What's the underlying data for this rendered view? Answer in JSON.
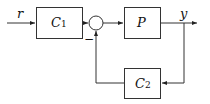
{
  "diagram": {
    "type": "block-diagram",
    "blocks": [
      {
        "id": "C1",
        "label": "C",
        "subscript": "1"
      },
      {
        "id": "P",
        "label": "P"
      },
      {
        "id": "C2",
        "label": "C",
        "subscript": "2"
      }
    ],
    "summing_junction": {
      "feedback_sign": "−"
    },
    "signals": {
      "input": "r",
      "output": "y"
    },
    "edges": [
      {
        "from": "r",
        "to": "C1"
      },
      {
        "from": "C1",
        "to": "sum"
      },
      {
        "from": "sum",
        "to": "P"
      },
      {
        "from": "P",
        "to": "y"
      },
      {
        "from": "y",
        "to": "C2"
      },
      {
        "from": "C2",
        "to": "sum",
        "sign": "−"
      }
    ]
  }
}
